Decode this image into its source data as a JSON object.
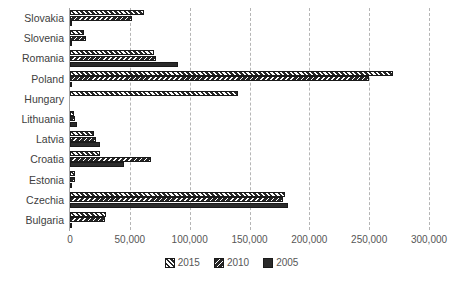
{
  "chart_data": {
    "type": "bar",
    "orientation": "horizontal",
    "title": "",
    "xlabel": "",
    "ylabel": "",
    "xlim": [
      0,
      300000
    ],
    "xticks": [
      0,
      50000,
      100000,
      150000,
      200000,
      250000,
      300000
    ],
    "xtick_labels": [
      "0",
      "50,000",
      "100,000",
      "150,000",
      "200,000",
      "250,000",
      "300,000"
    ],
    "grid": "vertical-dashed",
    "legend_position": "bottom-center",
    "categories": [
      "Slovakia",
      "Slovenia",
      "Romania",
      "Poland",
      "Hungary",
      "Lithuania",
      "Latvia",
      "Croatia",
      "Estonia",
      "Czechia",
      "Bulgaria"
    ],
    "series": [
      {
        "name": "2015",
        "values": [
          62000,
          12000,
          70000,
          270000,
          140000,
          3000,
          20000,
          25000,
          4000,
          180000,
          30000
        ]
      },
      {
        "name": "2010",
        "values": [
          52000,
          13500,
          72000,
          250000,
          0,
          4500,
          22000,
          68000,
          4500,
          178000,
          29000
        ]
      },
      {
        "name": "2005",
        "values": [
          1500,
          1000,
          90000,
          1500,
          0,
          5500,
          25000,
          45000,
          1200,
          182000,
          1500
        ]
      }
    ]
  },
  "legend": {
    "items": [
      {
        "label": "2015",
        "swatch": "hatch-forward-slash"
      },
      {
        "label": "2010",
        "swatch": "hatch-back-slash"
      },
      {
        "label": "2005",
        "swatch": "solid-dark"
      }
    ]
  },
  "colors": {
    "bar_fill": "#262626",
    "bar_edge": "#1a1a1a",
    "axis": "#a6a6a6",
    "gridline": "#b5b5b5",
    "text": "#565656",
    "category_text": "#404040",
    "background": "#ffffff"
  }
}
